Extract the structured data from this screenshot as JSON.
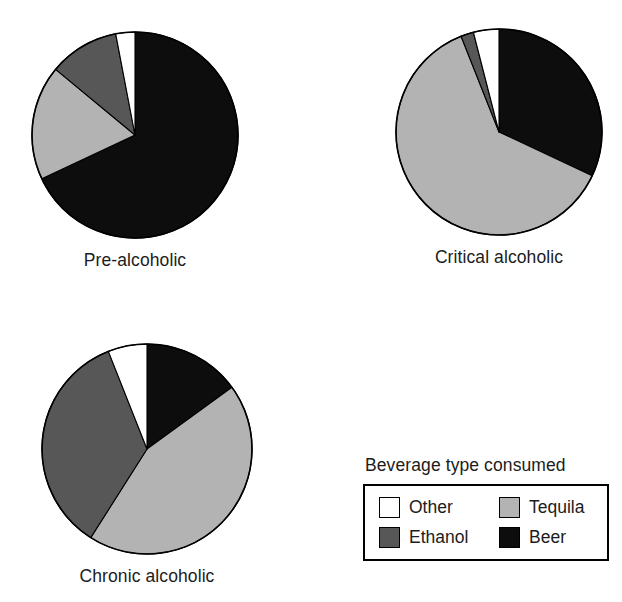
{
  "legend": {
    "title": "Beverage type consumed",
    "rows": [
      [
        {
          "label": "Other",
          "key": "other",
          "color": "#ffffff"
        },
        {
          "label": "Tequila",
          "key": "tequila",
          "color": "#b3b3b3"
        }
      ],
      [
        {
          "label": "Ethanol",
          "key": "ethanol",
          "color": "#575757"
        },
        {
          "label": "Beer",
          "key": "beer",
          "color": "#0d0d0d"
        }
      ]
    ]
  },
  "colors": {
    "other": "#ffffff",
    "tequila": "#b3b3b3",
    "ethanol": "#575757",
    "beer": "#0d0d0d",
    "outline": "#000000",
    "text": "#1c1c1c",
    "background": "#ffffff"
  },
  "chart_data": {
    "type": "pie",
    "title": "Beverage type consumed",
    "legend_position": "bottom-right",
    "legend_entries": [
      "Other",
      "Tequila",
      "Ethanol",
      "Beer"
    ],
    "slice_order": [
      "Beer",
      "Tequila",
      "Ethanol",
      "Other"
    ],
    "start_angle_deg": 0,
    "direction": "clockwise",
    "units": "percent",
    "charts": [
      {
        "title": "Pre-alcoholic",
        "categories": [
          "Beer",
          "Tequila",
          "Ethanol",
          "Other"
        ],
        "values": [
          68,
          18,
          11,
          3
        ]
      },
      {
        "title": "Critical alcoholic",
        "categories": [
          "Beer",
          "Tequila",
          "Ethanol",
          "Other"
        ],
        "values": [
          32,
          62,
          2,
          4
        ]
      },
      {
        "title": "Chronic alcoholic",
        "categories": [
          "Beer",
          "Tequila",
          "Ethanol",
          "Other"
        ],
        "values": [
          15,
          44,
          35,
          6
        ]
      }
    ]
  },
  "pies": [
    {
      "id": "pre-alcoholic",
      "caption": "Pre-alcoholic",
      "radius": 103,
      "cx": 107,
      "cy": 107
    },
    {
      "id": "critical-alcoholic",
      "caption": "Critical alcoholic",
      "radius": 103,
      "cx": 107,
      "cy": 107
    },
    {
      "id": "chronic-alcoholic",
      "caption": "Chronic alcoholic",
      "radius": 105,
      "cx": 109,
      "cy": 109
    }
  ]
}
